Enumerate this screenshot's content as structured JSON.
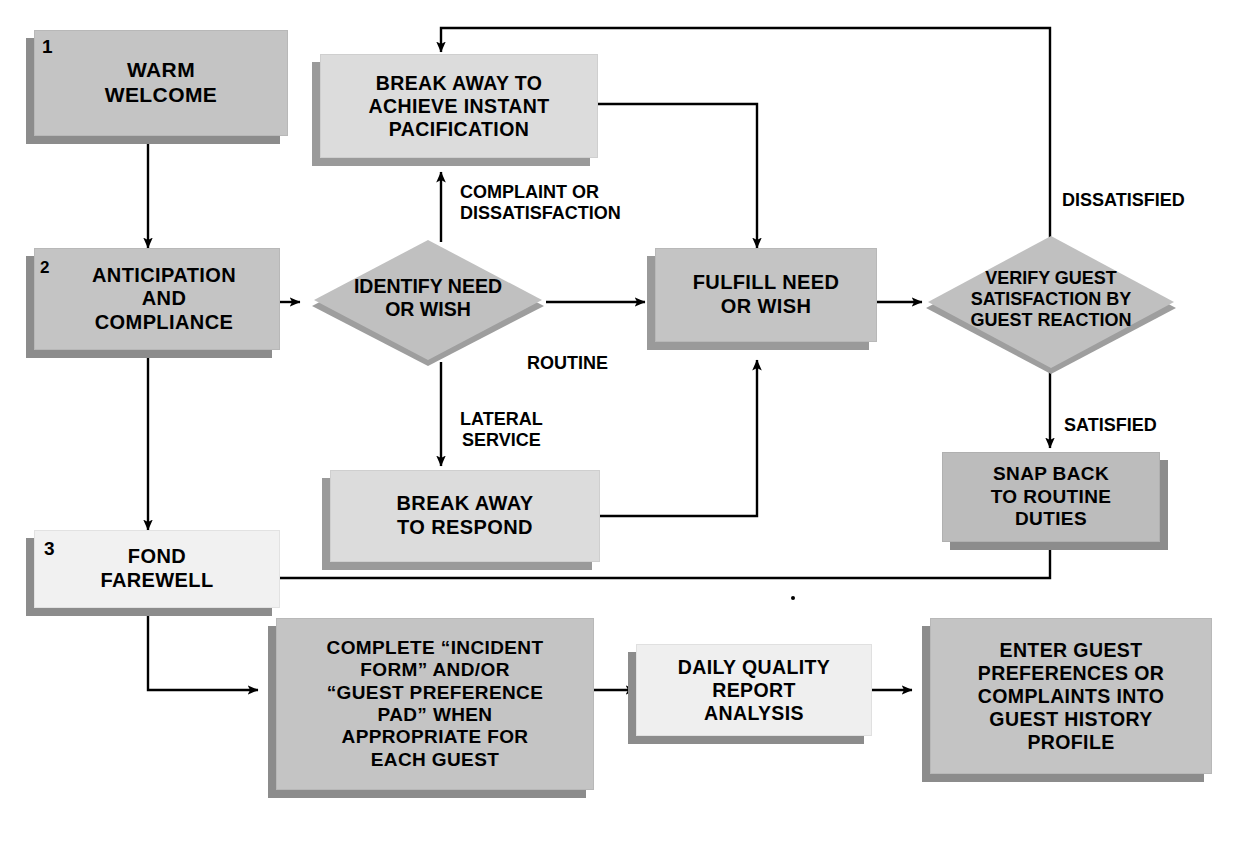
{
  "diagram": {
    "colors": {
      "node_fill_dark": "#bfbfbf",
      "node_fill_mid": "#cccccc",
      "node_fill_light": "#e6e6e6",
      "node_fill_pale": "#f2f2f2",
      "shadow": "#8c8c8c",
      "line": "#000000",
      "text": "#000000",
      "background": "#ffffff"
    }
  },
  "nodes": {
    "warm_welcome": {
      "label": "WARM\nWELCOME",
      "number": "1",
      "shape": "box"
    },
    "anticipation": {
      "label": "ANTICIPATION\nAND\nCOMPLIANCE",
      "number": "2",
      "shape": "box"
    },
    "fond_farewell": {
      "label": "FOND\nFAREWELL",
      "number": "3",
      "shape": "box"
    },
    "break_away_pacification": {
      "label": "BREAK AWAY TO\nACHIEVE INSTANT\nPACIFICATION",
      "shape": "box"
    },
    "identify_need": {
      "label": "IDENTIFY NEED\nOR WISH",
      "shape": "diamond"
    },
    "fulfill_need": {
      "label": "FULFILL NEED\nOR WISH",
      "shape": "box"
    },
    "verify_guest": {
      "label": "VERIFY GUEST\nSATISFACTION BY\nGUEST REACTION",
      "shape": "diamond"
    },
    "break_away_respond": {
      "label": "BREAK AWAY\nTO RESPOND",
      "shape": "box"
    },
    "snap_back": {
      "label": "SNAP BACK\nTO ROUTINE\nDUTIES",
      "shape": "box"
    },
    "complete_form": {
      "label": "COMPLETE “INCIDENT\nFORM” AND/OR\n“GUEST PREFERENCE\nPAD” WHEN\nAPPROPRIATE FOR\nEACH GUEST",
      "shape": "box"
    },
    "daily_quality": {
      "label": "DAILY QUALITY\nREPORT\nANALYSIS",
      "shape": "box"
    },
    "enter_guest": {
      "label": "ENTER GUEST\nPREFERENCES OR\nCOMPLAINTS INTO\nGUEST HISTORY\nPROFILE",
      "shape": "box"
    }
  },
  "edge_labels": {
    "complaint": "COMPLAINT OR\nDISSATISFACTION",
    "routine": "ROUTINE",
    "lateral": "LATERAL\nSERVICE",
    "dissatisfied": "DISSATISFIED",
    "satisfied": "SATISFIED"
  }
}
